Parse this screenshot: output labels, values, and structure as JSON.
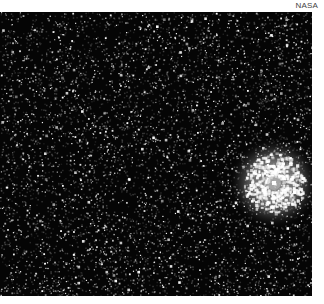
{
  "credit": {
    "text": "NASA"
  },
  "photo": {
    "subject": "starfield with bright planetary nebula",
    "background_color": "#050505",
    "star_color": "#ffffff",
    "width": 312,
    "height": 284,
    "star_count": 2600,
    "nebula": {
      "center_x": 274,
      "center_y": 171,
      "core_radius": 22,
      "halo_radius": 46,
      "color": "#f2f2f2"
    }
  }
}
